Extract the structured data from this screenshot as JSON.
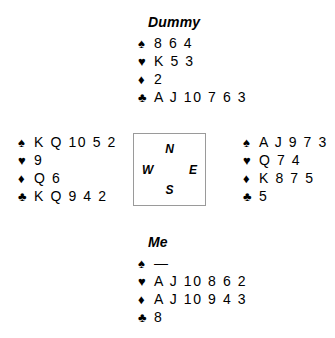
{
  "diagram": {
    "type": "bridge-deal",
    "suit_symbols": {
      "spade": "♠",
      "heart": "♥",
      "diamond": "♦",
      "club": "♣"
    },
    "void_marker": "—",
    "compass": {
      "north": "N",
      "east": "E",
      "south": "S",
      "west": "W"
    },
    "hands": {
      "north": {
        "label": "Dummy",
        "spades": "8 6 4",
        "hearts": "K 5 3",
        "diamonds": "2",
        "clubs": "A J 10 7 6 3"
      },
      "west": {
        "label": "",
        "spades": "K Q 10 5 2",
        "hearts": "9",
        "diamonds": "Q 6",
        "clubs": "K Q 9 4 2"
      },
      "east": {
        "label": "",
        "spades": "A J 9 7 3",
        "hearts": "Q 7 4",
        "diamonds": "K 8 7 5",
        "clubs": "5"
      },
      "south": {
        "label": "Me",
        "spades": "—",
        "hearts": "A J 10 8 6 2",
        "diamonds": "A J 10 9 4 3",
        "clubs": "8"
      }
    }
  }
}
